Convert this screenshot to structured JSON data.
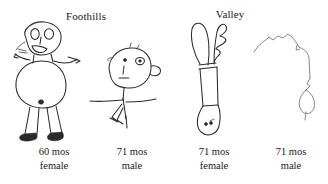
{
  "plate": {
    "background_color": "#ffffff",
    "ink_color": "#2b2b2b"
  },
  "groups": [
    {
      "id": "foothills",
      "label": "Foothills"
    },
    {
      "id": "valley",
      "label": "Valley"
    }
  ],
  "drawings": [
    {
      "id": "drawing-1",
      "group": "Foothills",
      "description": "child drawing of a person with large round head, two eyes, open mouth, outstretched arms, large oval body with navel, two long legs and dark feet",
      "caption": {
        "age": "60 mos",
        "sex": "female"
      }
    },
    {
      "id": "drawing-2",
      "group": "Foothills",
      "description": "child drawing of a stick person with a tilted oval head in profile, eyes, nose, mouth, ear, straight arms and a zigzag leg",
      "caption": {
        "age": "71 mos",
        "sex": "male"
      }
    },
    {
      "id": "drawing-3",
      "group": "Valley",
      "description": "child drawing of a tall narrow figure with two raised loop arms, long tube body widening to a pear shape with two dots",
      "caption": {
        "age": "71 mos",
        "sex": "female"
      }
    },
    {
      "id": "drawing-4",
      "group": "Valley",
      "description": "faint child drawing of a jagged arched outline descending into a thin line and a small diamond shape",
      "caption": {
        "age": "71 mos",
        "sex": "male"
      }
    }
  ]
}
